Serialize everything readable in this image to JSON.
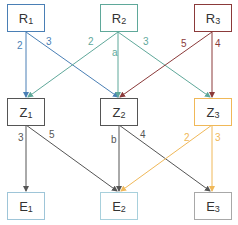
{
  "colors": {
    "R1": "#4a7fb5",
    "R2": "#5fa89a",
    "R3": "#8b3a3a",
    "Z1": "#555555",
    "Z2": "#555555",
    "Z3": "#f0b858",
    "E1": "#9ec5d8",
    "E2": "#a8d0dc",
    "E3": "#a8a8a8"
  },
  "nodes": {
    "R1": {
      "base": "R",
      "sub": "1"
    },
    "R2": {
      "base": "R",
      "sub": "2"
    },
    "R3": {
      "base": "R",
      "sub": "3"
    },
    "Z1": {
      "base": "Z",
      "sub": "1"
    },
    "Z2": {
      "base": "Z",
      "sub": "2"
    },
    "Z3": {
      "base": "Z",
      "sub": "3"
    },
    "E1": {
      "base": "E",
      "sub": "1"
    },
    "E2": {
      "base": "E",
      "sub": "2"
    },
    "E3": {
      "base": "E",
      "sub": "3"
    }
  },
  "edges": [
    {
      "from": "R1",
      "to": "Z1",
      "label": "2"
    },
    {
      "from": "R1",
      "to": "Z2",
      "label": "3"
    },
    {
      "from": "R2",
      "to": "Z1",
      "label": "2"
    },
    {
      "from": "R2",
      "to": "Z2",
      "label": "a"
    },
    {
      "from": "R2",
      "to": "Z3",
      "label": "3"
    },
    {
      "from": "R3",
      "to": "Z2",
      "label": "5"
    },
    {
      "from": "R3",
      "to": "Z3",
      "label": "4"
    },
    {
      "from": "Z1",
      "to": "E1",
      "label": "3"
    },
    {
      "from": "Z1",
      "to": "E2",
      "label": "5"
    },
    {
      "from": "Z2",
      "to": "E2",
      "label": "b"
    },
    {
      "from": "Z2",
      "to": "E3",
      "label": "4"
    },
    {
      "from": "Z3",
      "to": "E2",
      "label": "2"
    },
    {
      "from": "Z3",
      "to": "E3",
      "label": "3"
    }
  ]
}
